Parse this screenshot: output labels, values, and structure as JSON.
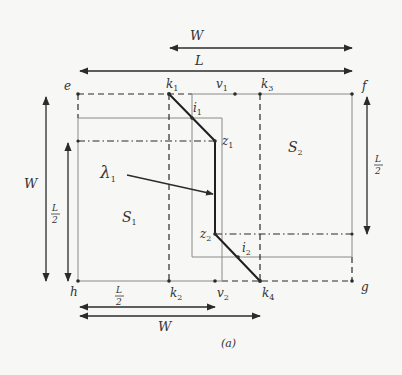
{
  "caption": "(a)",
  "colors": {
    "ink": "#2b2b2b",
    "grey_rect": "#8a8a8a",
    "background": "#f7f7f5"
  },
  "points": {
    "e": {
      "label": "e",
      "x": 78,
      "y": 94
    },
    "f": {
      "label": "f",
      "x": 352,
      "y": 94
    },
    "g": {
      "label": "g",
      "x": 352,
      "y": 281
    },
    "h": {
      "label": "h",
      "x": 78,
      "y": 281
    },
    "k1": {
      "label": "k",
      "sub": "1",
      "x": 169,
      "y": 94
    },
    "v1": {
      "label": "v",
      "sub": "1",
      "x": 235,
      "y": 94
    },
    "k3": {
      "label": "k",
      "sub": "3",
      "x": 280,
      "y": 94
    },
    "k2": {
      "label": "k",
      "sub": "2",
      "x": 169,
      "y": 281
    },
    "v2": {
      "label": "v",
      "sub": "2",
      "x": 215,
      "y": 281
    },
    "k4": {
      "label": "k",
      "sub": "4",
      "x": 260,
      "y": 281
    },
    "i1": {
      "label": "i",
      "sub": "1",
      "x": 192,
      "y": 118
    },
    "i2": {
      "label": "i",
      "sub": "2",
      "x": 238,
      "y": 257
    },
    "z1": {
      "label": "z",
      "sub": "1",
      "x": 215,
      "y": 141
    },
    "z2": {
      "label": "z",
      "sub": "2",
      "x": 215,
      "y": 234
    }
  },
  "regions": {
    "s1": {
      "label": "S",
      "sub": "1"
    },
    "s2": {
      "label": "S",
      "sub": "2"
    }
  },
  "path_label": {
    "label": "λ",
    "sub": "1"
  },
  "dimensions": {
    "top_W": "W",
    "top_L": "L",
    "left_W": "W",
    "left_L_half_num": "L",
    "left_L_half_den": "2",
    "right_L_half_num": "L",
    "right_L_half_den": "2",
    "bottom_L_half_num": "L",
    "bottom_L_half_den": "2",
    "bottom_W": "W"
  }
}
